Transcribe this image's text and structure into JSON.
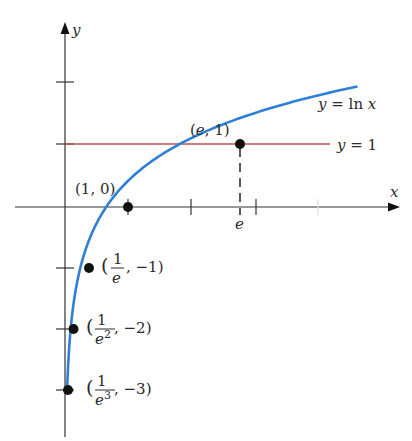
{
  "figure": {
    "axes": {
      "x_label": "x",
      "y_label": "y",
      "x_ticks": [
        1,
        2,
        3,
        4
      ],
      "y_ticks": [
        2,
        1,
        -1,
        -2,
        -3
      ],
      "x_special_tick_label": "e"
    },
    "curves": [
      {
        "name": "ln-curve",
        "label": "y = ln x",
        "color": "#2f7fd6"
      },
      {
        "name": "horizontal-line",
        "label": "y = 1",
        "color": "#c0504d"
      }
    ],
    "points": [
      {
        "name": "point-1-0",
        "label": "(1, 0)",
        "x": 1,
        "y": 0
      },
      {
        "name": "point-e-1",
        "label": "(e, 1)",
        "x": 2.718,
        "y": 1
      },
      {
        "name": "point-1e-neg1",
        "num": "1",
        "den": "e",
        "tail": ", −1)",
        "open": "(",
        "x": 0.368,
        "y": -1
      },
      {
        "name": "point-1e2-neg2",
        "num": "1",
        "den": "e",
        "den_sup": "2",
        "tail": ", −2)",
        "open": "(",
        "x": 0.135,
        "y": -2
      },
      {
        "name": "point-1e3-neg3",
        "num": "1",
        "den": "e",
        "den_sup": "3",
        "tail": ", −3)",
        "open": "(",
        "x": 0.0498,
        "y": -3
      }
    ],
    "labels": {
      "ln_curve": "y = ln x",
      "line": "y = 1",
      "p10": "(1, 0)",
      "pe1": "(e, 1)",
      "e_tick": "e",
      "x_axis": "x",
      "y_axis": "y"
    }
  }
}
